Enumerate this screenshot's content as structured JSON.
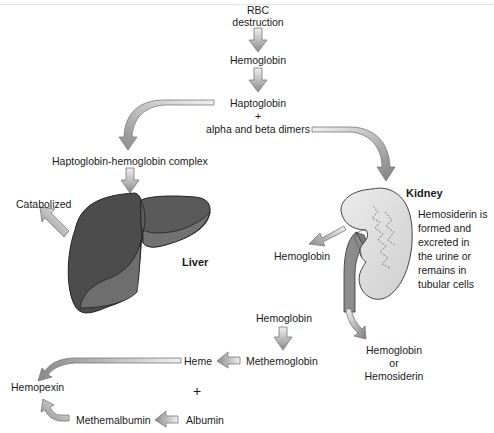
{
  "diagram": {
    "colors": {
      "arrow_fill_light": "#e6e6e6",
      "arrow_fill_dark": "#8a8a8a",
      "arrow_stroke": "#7a7a7a",
      "liver_dark": "#4a4a4a",
      "liver_light": "#6e6e6e",
      "kidney_fill": "#dcdcdc",
      "ureter_fill": "#8c8c8c",
      "text": "#1a1a1a"
    },
    "nodes": {
      "rbc": "RBC",
      "destruction": "destruction",
      "hemoglobin_top": "Hemoglobin",
      "haptoglobin": "Haptoglobin",
      "plus_top": "+",
      "alpha_beta": "alpha and beta dimers",
      "hp_hb_complex": "Haptoglobin-hemoglobin complex",
      "catabolized": "Catabolized",
      "liver": "Liver",
      "kidney": "Kidney",
      "hemosiderin_note": [
        "Hemosiderin is",
        "formed and",
        "excreted in",
        "the urine or",
        "remains in",
        "tubular cells"
      ],
      "hemoglobin_kidney_left": "Hemoglobin",
      "hemoglobin_or": "Hemoglobin",
      "or": "or",
      "hemosiderin": "Hemosiderin",
      "hemoglobin_bottom": "Hemoglobin",
      "methemoglobin": "Methemoglobin",
      "heme": "Heme",
      "plus_bottom": "+",
      "hemopexin": "Hemopexin",
      "methemalbumin": "Methemalbumin",
      "albumin": "Albumin"
    },
    "edges": [
      {
        "from": "RBC destruction",
        "to": "Hemoglobin"
      },
      {
        "from": "Hemoglobin",
        "to": "Haptoglobin + alpha and beta dimers"
      },
      {
        "from": "Haptoglobin + alpha and beta dimers",
        "to": "Haptoglobin-hemoglobin complex"
      },
      {
        "from": "Haptoglobin + alpha and beta dimers",
        "to": "Kidney"
      },
      {
        "from": "Haptoglobin-hemoglobin complex",
        "to": "Liver"
      },
      {
        "from": "Liver",
        "to": "Catabolized"
      },
      {
        "from": "Kidney",
        "to": "Hemoglobin"
      },
      {
        "from": "Kidney",
        "to": "Hemoglobin or Hemosiderin"
      },
      {
        "from": "Hemoglobin",
        "to": "Methemoglobin"
      },
      {
        "from": "Methemoglobin",
        "to": "Heme"
      },
      {
        "from": "Heme",
        "to": "Hemopexin"
      },
      {
        "from": "Albumin",
        "to": "Methemalbumin"
      },
      {
        "from": "Methemalbumin",
        "to": "Hemopexin"
      }
    ]
  }
}
